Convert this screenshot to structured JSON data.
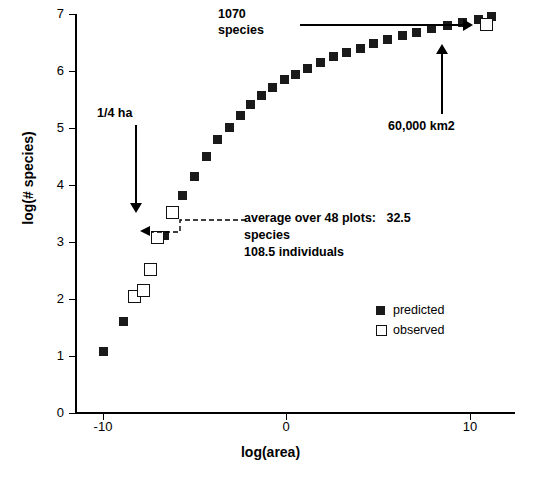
{
  "chart_data": {
    "type": "scatter",
    "title": "",
    "xlabel": "log(area)",
    "ylabel": "log(# species)",
    "xlim": [
      -11.5,
      12.5
    ],
    "ylim": [
      0,
      7
    ],
    "xticks": [
      -10,
      0,
      10
    ],
    "yticks": [
      0,
      1,
      2,
      3,
      4,
      5,
      6,
      7
    ],
    "grid": false,
    "legend_position": "lower-right-inside",
    "series": [
      {
        "name": "predicted",
        "marker": "filled-square",
        "color": "#1a1a1a",
        "points": [
          [
            -9.95,
            1.1
          ],
          [
            -8.85,
            1.62
          ],
          [
            -8.25,
            2.05
          ],
          [
            -7.75,
            2.15
          ],
          [
            -7.35,
            2.52
          ],
          [
            -6.95,
            3.05
          ],
          [
            -6.6,
            3.12
          ],
          [
            -6.15,
            3.52
          ],
          [
            -5.65,
            3.82
          ],
          [
            -5.0,
            4.15
          ],
          [
            -4.35,
            4.5
          ],
          [
            -3.75,
            4.8
          ],
          [
            -3.1,
            5.02
          ],
          [
            -2.5,
            5.22
          ],
          [
            -1.95,
            5.42
          ],
          [
            -1.35,
            5.58
          ],
          [
            -0.75,
            5.72
          ],
          [
            -0.1,
            5.85
          ],
          [
            0.55,
            5.95
          ],
          [
            1.2,
            6.05
          ],
          [
            1.9,
            6.15
          ],
          [
            2.6,
            6.25
          ],
          [
            3.3,
            6.32
          ],
          [
            4.05,
            6.4
          ],
          [
            4.8,
            6.48
          ],
          [
            5.55,
            6.55
          ],
          [
            6.35,
            6.62
          ],
          [
            7.15,
            6.68
          ],
          [
            7.95,
            6.75
          ],
          [
            8.8,
            6.8
          ],
          [
            9.65,
            6.85
          ],
          [
            10.5,
            6.9
          ],
          [
            11.2,
            6.95
          ]
        ]
      },
      {
        "name": "observed",
        "marker": "open-square",
        "color": "#ffffff",
        "points": [
          [
            -8.25,
            2.05
          ],
          [
            -7.75,
            2.15
          ],
          [
            -7.35,
            2.52
          ],
          [
            -6.95,
            3.08
          ],
          [
            -6.15,
            3.52
          ],
          [
            10.95,
            6.8
          ]
        ]
      }
    ],
    "annotations": [
      {
        "name": "quarter-hectare",
        "text": "1/4 ha",
        "x": -6.2,
        "y": 5.0
      },
      {
        "name": "species-count-1070",
        "text": "1070\nspecies",
        "x": 0.5,
        "y": 7.1
      },
      {
        "name": "area-60000-km2",
        "text": "60,000 km2",
        "x": 7.3,
        "y": 4.6
      },
      {
        "name": "plot-average",
        "text": "average over 48 plots:   32.5\nspecies\n108.5 individuals",
        "x": -4.0,
        "y": 3.6
      }
    ]
  },
  "legend": {
    "items": [
      {
        "label": "predicted",
        "marker": "filled-square"
      },
      {
        "label": "observed",
        "marker": "open-square"
      }
    ]
  },
  "annotation_text": {
    "quarter_ha": "1/4 ha",
    "species_1070_line1": "1070",
    "species_1070_line2": "species",
    "area_60000": "60,000 km2",
    "avg_line1": "average over 48 plots:   32.5",
    "avg_line2": "species",
    "avg_line3": "108.5 individuals"
  },
  "axis": {
    "x_title": "log(area)",
    "y_title": "log(# species)",
    "y_ticks": [
      "7",
      "6",
      "5",
      "4",
      "3",
      "2",
      "1",
      "0"
    ],
    "x_ticks": [
      "-10",
      "0",
      "10"
    ]
  }
}
